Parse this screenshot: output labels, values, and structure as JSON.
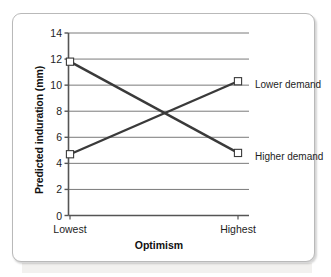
{
  "chart_data": {
    "type": "line",
    "title": "",
    "xlabel": "Optimism",
    "ylabel": "Predicted induration (mm)",
    "categories": [
      "Lowest",
      "Highest"
    ],
    "series": [
      {
        "name": "Higher demand",
        "values": [
          11.8,
          4.8
        ]
      },
      {
        "name": "Lower demand",
        "values": [
          4.7,
          10.3
        ]
      }
    ],
    "ylim": [
      0,
      14
    ],
    "yticks": [
      0,
      2,
      4,
      6,
      8,
      10,
      12,
      14
    ],
    "ytick_labels": [
      "0",
      "2",
      "4",
      "6",
      "8",
      "10",
      "12",
      "14"
    ],
    "xtick_labels": [
      "Lowest",
      "Highest"
    ],
    "grid": "horizontal",
    "legend_position": "inline-right",
    "marker": "open-square",
    "line_color": "#3a3a3a",
    "grid_color": "#7a7a7a",
    "axis_color": "#555555"
  },
  "axes": {
    "y_title": "Predicted induration (mm)",
    "x_title": "Optimism"
  },
  "labels": {
    "lower_demand": "Lower demand",
    "higher_demand": "Higher demand"
  }
}
